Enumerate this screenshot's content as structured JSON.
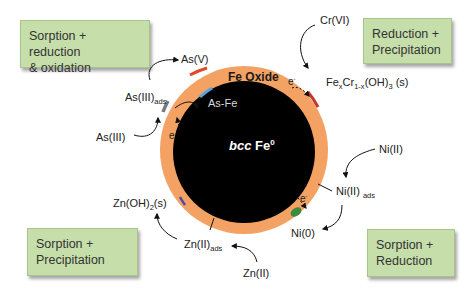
{
  "boxes": {
    "top_left": {
      "line1": "Sorption + reduction",
      "line2": "& oxidation"
    },
    "top_right": {
      "line1": "Reduction +",
      "line2": "Precipitation"
    },
    "bottom_left": {
      "line1": "Sorption +",
      "line2": "Precipitation"
    },
    "bottom_right": {
      "line1": "Sorption +",
      "line2": "Reduction"
    }
  },
  "particle": {
    "shell_label": "Fe Oxide",
    "core_label_italic": "bcc",
    "core_label": " Fe",
    "core_sup": "0",
    "inner_label": "As-Fe",
    "colors": {
      "shell": "#f4a263",
      "core": "#000000",
      "box": "#c6deaa"
    }
  },
  "species": {
    "as_v": "As(V)",
    "as_iii_ads": "As(III)",
    "as_iii_ads_sub": "ads",
    "as_iii": "As(III)",
    "cr_vi": "Cr(VI)",
    "fecr_pre": "Fe",
    "fecr_x": "x",
    "fecr_mid": "Cr",
    "fecr_sub2": "1-x",
    "fecr_post": "(OH)",
    "fecr_sub3": "3",
    "fecr_tail": " (s)",
    "ni_ii": "Ni(II)",
    "ni_ii_ads": "Ni(II) ",
    "ni_ii_ads_sub": "ads",
    "ni_0": "Ni(0)",
    "zn_oh2": "Zn(OH)",
    "zn_oh2_sub": "2",
    "zn_oh2_tail": "(s)",
    "zn_ii_ads": "Zn(II)",
    "zn_ii_ads_sub": "ads",
    "zn_ii": "Zn(II)"
  },
  "electron": {
    "symbol": "e",
    "charge": "-"
  }
}
